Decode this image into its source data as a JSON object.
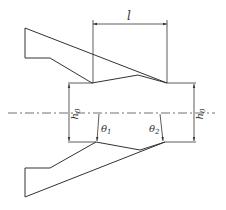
{
  "diagram": {
    "type": "cutting-blade-geometry",
    "labels": {
      "length": "l",
      "height_left": "h",
      "height_left_sub": "0",
      "height_right": "h",
      "height_right_sub": "0",
      "angle1": "θ",
      "angle1_sub": "1",
      "angle2": "θ",
      "angle2_sub": "2"
    },
    "colors": {
      "stroke": "#333333",
      "background": "#ffffff"
    }
  }
}
